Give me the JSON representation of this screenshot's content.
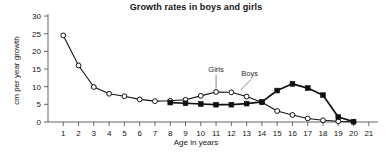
{
  "chart_data": {
    "type": "line",
    "title": "Growth rates in boys and girls",
    "xlabel": "Age in years",
    "ylabel": "cm per year growth",
    "xlim": [
      0,
      21.6
    ],
    "ylim": [
      0,
      30
    ],
    "xticks": [
      1,
      2,
      3,
      4,
      5,
      6,
      7,
      8,
      9,
      10,
      11,
      12,
      13,
      14,
      15,
      16,
      17,
      18,
      19,
      20,
      21
    ],
    "yticks": [
      0,
      5,
      10,
      15,
      20,
      25,
      30
    ],
    "grid": false,
    "legend_position": "inline-annotation",
    "annotations": [
      {
        "text": "Girls",
        "x": 11,
        "y": 14.2
      },
      {
        "text": "Boys",
        "x": 13.2,
        "y": 13.0
      }
    ],
    "series": [
      {
        "name": "Girls",
        "marker": "open-circle",
        "color": "#111111",
        "x": [
          1,
          2,
          3,
          4,
          5,
          6,
          7,
          8,
          9,
          10,
          11,
          12,
          13,
          14,
          15,
          16,
          17,
          18,
          19,
          20
        ],
        "values": [
          24.5,
          16.0,
          9.9,
          8.0,
          7.3,
          6.4,
          5.9,
          6.0,
          6.3,
          7.4,
          8.5,
          8.4,
          7.2,
          5.6,
          3.1,
          2.0,
          1.0,
          0.5,
          0.2,
          0.0
        ]
      },
      {
        "name": "Boys",
        "marker": "filled-square",
        "color": "#111111",
        "x": [
          8,
          9,
          10,
          11,
          12,
          13,
          14,
          15,
          16,
          17,
          18,
          19,
          20
        ],
        "values": [
          5.5,
          5.3,
          5.1,
          4.9,
          4.9,
          5.2,
          5.7,
          8.9,
          10.8,
          9.6,
          7.6,
          1.4,
          0.1
        ]
      }
    ]
  },
  "axis": {
    "y_tick_labels": [
      "0",
      "5",
      "10",
      "15",
      "20",
      "25",
      "30"
    ],
    "x_tick_labels": [
      "1",
      "2",
      "3",
      "4",
      "5",
      "6",
      "7",
      "8",
      "9",
      "10",
      "11",
      "12",
      "13",
      "14",
      "15",
      "16",
      "17",
      "18",
      "19",
      "20",
      "21"
    ]
  }
}
